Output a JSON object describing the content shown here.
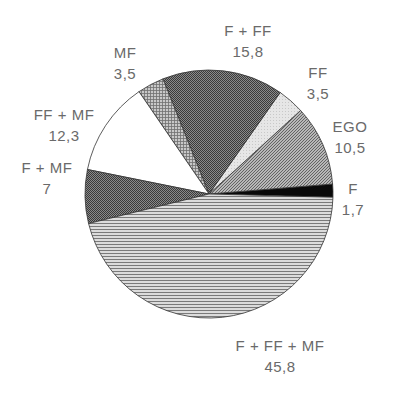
{
  "chart_data": {
    "type": "pie",
    "title": "",
    "start_angle_deg": -1.5,
    "direction": "counterclockwise",
    "center": [
      209,
      194
    ],
    "radius": 124,
    "slices": [
      {
        "label": "F",
        "value": 1.7,
        "value_text": "1,7",
        "fill": "pat-black",
        "label_pos": [
          353,
          178
        ]
      },
      {
        "label": "EGO",
        "value": 10.5,
        "value_text": "10,5",
        "fill": "pat-diag-mid",
        "label_pos": [
          350,
          116
        ]
      },
      {
        "label": "FF",
        "value": 3.5,
        "value_text": "3,5",
        "fill": "pat-light",
        "label_pos": [
          318,
          62
        ]
      },
      {
        "label": "F + FF",
        "value": 15.8,
        "value_text": "15,8",
        "fill": "pat-dark-check",
        "label_pos": [
          248,
          20
        ]
      },
      {
        "label": "MF",
        "value": 3.5,
        "value_text": "3,5",
        "fill": "pat-grid",
        "label_pos": [
          125,
          42
        ]
      },
      {
        "label": "FF + MF",
        "value": 12.3,
        "value_text": "12,3",
        "fill": "pat-white",
        "label_pos": [
          64,
          104
        ]
      },
      {
        "label": "F + MF",
        "value": 7,
        "value_text": "7",
        "fill": "pat-dark-check",
        "label_pos": [
          47,
          157
        ]
      },
      {
        "label": "F + FF + MF",
        "value": 45.8,
        "value_text": "45,8",
        "fill": "pat-hlines",
        "label_pos": [
          280,
          335
        ]
      }
    ],
    "labels": [
      "F",
      "EGO",
      "FF",
      "F + FF",
      "MF",
      "FF + MF",
      "F + MF",
      "F + FF + MF"
    ],
    "values": [
      1.7,
      10.5,
      3.5,
      15.8,
      3.5,
      12.3,
      7,
      45.8
    ],
    "legend": "none (direct labels)",
    "grid": false
  },
  "colors": {
    "outline": "#333333",
    "label_text": "#6a6a6a"
  }
}
